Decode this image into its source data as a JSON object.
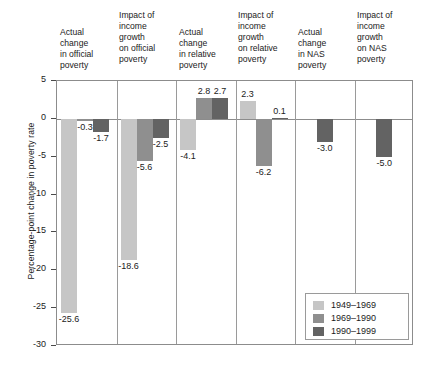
{
  "axis": {
    "y_title": "Percentage-point change in poverty rate",
    "ticks": [
      "5",
      "0",
      "-5",
      "-10",
      "-15",
      "-20",
      "-25",
      "-30"
    ]
  },
  "legend": {
    "items": [
      {
        "label": "1949–1969",
        "color": "#c6c6c6"
      },
      {
        "label": "1969–1990",
        "color": "#8f8f8f"
      },
      {
        "label": "1990–1999",
        "color": "#636363"
      }
    ]
  },
  "headers": [
    "Actual change in official poverty",
    "Impact of income growth on official poverty",
    "Actual change in relative poverty",
    "Impact of income growth on relative poverty",
    "Actual change in NAS poverty",
    "Impact of income growth on NAS poverty"
  ],
  "header_lines": [
    [
      "Actual",
      "change",
      "in official",
      "poverty"
    ],
    [
      "Impact of",
      "income",
      "growth",
      "on official",
      "poverty"
    ],
    [
      "Actual",
      "change",
      "in relative",
      "poverty"
    ],
    [
      "Impact of",
      "income",
      "growth",
      "on relative",
      "poverty"
    ],
    [
      "Actual",
      "change",
      "in NAS",
      "poverty"
    ],
    [
      "Impact of",
      "income",
      "growth",
      "on NAS",
      "poverty"
    ]
  ],
  "value_labels": {
    "g0": [
      "-25.6",
      "-0.3",
      "-1.7"
    ],
    "g1": [
      "-18.6",
      "-5.6",
      "-2.5"
    ],
    "g2": [
      "-4.1",
      "2.8",
      "2.7"
    ],
    "g3": [
      "2.3",
      "-6.2",
      "0.1"
    ],
    "g4": [
      "-3.0"
    ],
    "g5": [
      "-5.0"
    ]
  },
  "chart_data": {
    "type": "bar",
    "title": "",
    "xlabel": "",
    "ylabel": "Percentage-point change in poverty rate",
    "ylim": [
      -30,
      5
    ],
    "yticks": [
      5,
      0,
      -5,
      -10,
      -15,
      -20,
      -25,
      -30
    ],
    "grid": false,
    "legend_position": "bottom-right",
    "categories": [
      "Actual change in official poverty",
      "Impact of income growth on official poverty",
      "Actual change in relative poverty",
      "Impact of income growth on relative poverty",
      "Actual change in NAS poverty",
      "Impact of income growth on NAS poverty"
    ],
    "series": [
      {
        "name": "1949–1969",
        "color": "#c6c6c6",
        "values": [
          -25.6,
          -18.6,
          -4.1,
          2.3,
          null,
          null
        ]
      },
      {
        "name": "1969–1990",
        "color": "#8f8f8f",
        "values": [
          -0.3,
          -5.6,
          2.8,
          -6.2,
          null,
          null
        ]
      },
      {
        "name": "1990–1999",
        "color": "#636363",
        "values": [
          -1.7,
          -2.5,
          2.7,
          0.1,
          -3.0,
          -5.0
        ]
      }
    ]
  }
}
